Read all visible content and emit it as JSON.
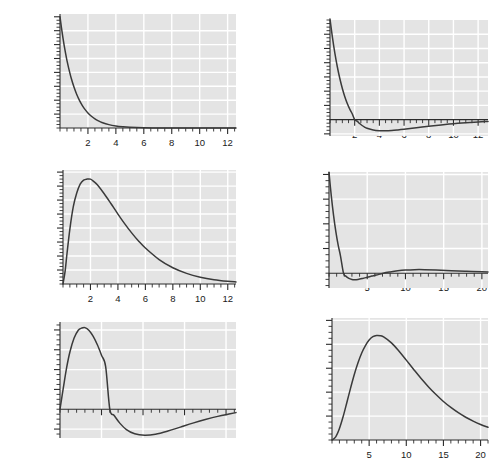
{
  "figure": {
    "title": "",
    "panel_count": 6,
    "background_color": "#e4e4e4",
    "gridline_color": "#ffffff",
    "curve_color": "#3a3a3a",
    "axis_color": "#2b2b2b"
  },
  "chart_data": [
    {
      "id": "1s",
      "type": "line",
      "title": "",
      "annotation": "1s",
      "annotation_n": "1",
      "annotation_l": "s",
      "xlabel": "",
      "ylabel": "",
      "xlim": [
        0,
        12.6
      ],
      "ylim": [
        0,
        2.05
      ],
      "grid": true,
      "xticks_major": [
        2,
        4,
        6,
        8,
        10,
        12
      ],
      "xticklabels": [
        "2",
        "4",
        "6",
        "8",
        "10",
        "12"
      ],
      "xtick_minor_step": 0.5,
      "yticks_major": [
        0.25,
        0.5,
        0.75,
        1,
        1.25,
        1.5,
        1.75,
        2
      ],
      "yticklabels": [
        "0.25",
        "0.5",
        "0.75",
        "1",
        "1.25",
        "1.5",
        "1.75",
        "2"
      ],
      "ytick_minor_step": 0.0625,
      "gridlines_y": [
        0.25,
        0.5,
        0.75,
        1,
        1.25,
        1.5,
        1.75
      ],
      "gridlines_x": [
        2,
        4,
        6,
        8,
        10,
        12
      ],
      "x": [
        0,
        0.1,
        0.2,
        0.3,
        0.4,
        0.5,
        0.6,
        0.8,
        1.0,
        1.2,
        1.4,
        1.6,
        1.8,
        2.0,
        2.25,
        2.5,
        2.75,
        3.0,
        3.5,
        4.0,
        4.5,
        5.0,
        6.0,
        7.0,
        8.0,
        9.0,
        10.0,
        11.0,
        12.0,
        12.6
      ],
      "y": [
        2.0,
        1.81,
        1.637,
        1.482,
        1.341,
        1.213,
        1.098,
        0.898,
        0.736,
        0.602,
        0.493,
        0.404,
        0.331,
        0.271,
        0.211,
        0.164,
        0.128,
        0.0995,
        0.0604,
        0.0366,
        0.0222,
        0.0135,
        0.00496,
        0.00182,
        0.00067,
        0.00025,
        9e-05,
        3e-05,
        1e-05,
        6e-06
      ]
    },
    {
      "id": "2s",
      "type": "line",
      "title": "",
      "annotation": "2s",
      "annotation_n": "2",
      "annotation_l": "s",
      "xlabel": "",
      "ylabel": "",
      "xlim": [
        0,
        12.8
      ],
      "ylim": [
        -0.115,
        0.7
      ],
      "grid": true,
      "xticks_major": [
        2,
        4,
        6,
        8,
        10,
        12
      ],
      "xticklabels": [
        "2",
        "4",
        "6",
        "8",
        "10",
        "12"
      ],
      "xtick_minor_step": 0.5,
      "yticks_major": [
        -0.1,
        0.1,
        0.2,
        0.3,
        0.4,
        0.5,
        0.6
      ],
      "yticklabels": [
        "-0.1",
        "0.1",
        "0.2",
        "0.3",
        "0.4",
        "0.5",
        "0.6"
      ],
      "ytick_minor_step": 0.025,
      "gridlines_y": [
        -0.1,
        0.1,
        0.2,
        0.3,
        0.4,
        0.5,
        0.6
      ],
      "gridlines_x": [
        2,
        4,
        6,
        8,
        10,
        12
      ],
      "zero_crossing": 2.0,
      "minimum": {
        "x": 4.0,
        "y": -0.0918
      },
      "x": [
        0,
        0.2,
        0.4,
        0.6,
        0.8,
        1.0,
        1.2,
        1.4,
        1.6,
        1.8,
        2.0,
        2.2,
        2.4,
        2.6,
        2.8,
        3.0,
        3.5,
        4.0,
        4.5,
        5.0,
        5.5,
        6.0,
        7.0,
        8.0,
        9.0,
        10.0,
        11.0,
        12.0,
        12.8
      ],
      "y": [
        0.707,
        0.576,
        0.464,
        0.368,
        0.287,
        0.219,
        0.161,
        0.113,
        0.0737,
        0.0415,
        0.0,
        -0.0105,
        -0.0276,
        -0.0413,
        -0.0522,
        -0.0607,
        -0.0733,
        -0.0782,
        -0.0787,
        -0.0765,
        -0.0726,
        -0.0678,
        -0.0572,
        -0.0466,
        -0.037,
        -0.0287,
        -0.0219,
        -0.0164,
        -0.0133
      ]
    },
    {
      "id": "2p",
      "type": "line",
      "title": "",
      "annotation": "2p",
      "annotation_n": "2",
      "annotation_l": "p",
      "xlabel": "",
      "ylabel": "",
      "xlim": [
        0,
        12.6
      ],
      "ylim": [
        0,
        0.163
      ],
      "grid": true,
      "xticks_major": [
        2,
        4,
        6,
        8,
        10,
        12
      ],
      "xticklabels": [
        "2",
        "4",
        "6",
        "8",
        "10",
        "12"
      ],
      "xtick_minor_step": 0.5,
      "yticks_major": [
        0.02,
        0.04,
        0.06,
        0.08,
        0.1,
        0.12,
        0.14,
        0.16
      ],
      "yticklabels": [
        "0.02",
        "0.04",
        "0.06",
        "0.08",
        "0.1",
        "0.12",
        "0.14",
        "0.16"
      ],
      "ytick_minor_step": 0.005,
      "gridlines_y": [
        0.02,
        0.04,
        0.06,
        0.08,
        0.1,
        0.12,
        0.14,
        0.16
      ],
      "gridlines_x": [
        2,
        4,
        6,
        8,
        10,
        12
      ],
      "maximum": {
        "x": 2.0,
        "y": 0.15
      },
      "x": [
        0,
        0.15,
        0.3,
        0.5,
        0.75,
        1.0,
        1.25,
        1.5,
        1.75,
        2.0,
        2.25,
        2.5,
        3.0,
        3.5,
        4.0,
        4.5,
        5.0,
        5.5,
        6.0,
        7.0,
        8.0,
        9.0,
        10.0,
        11.0,
        12.0,
        12.6
      ],
      "y": [
        0.0,
        0.0176,
        0.045,
        0.0786,
        0.1106,
        0.13,
        0.1428,
        0.1485,
        0.15,
        0.1499,
        0.1464,
        0.1418,
        0.129,
        0.1147,
        0.1,
        0.086,
        0.0731,
        0.0615,
        0.0514,
        0.0349,
        0.0232,
        0.0152,
        0.0098,
        0.0062,
        0.0039,
        0.003
      ]
    },
    {
      "id": "3s",
      "type": "line",
      "title": "",
      "annotation": "3s",
      "annotation_n": "3",
      "annotation_l": "s",
      "xlabel": "",
      "ylabel": "",
      "xlim": [
        0,
        20.8
      ],
      "ylim": [
        -0.06,
        0.41
      ],
      "grid": true,
      "xticks_major": [
        5,
        10,
        15,
        20
      ],
      "xticklabels": [
        "5",
        "10",
        "15",
        "20"
      ],
      "xtick_minor_step": 1,
      "yticks_major": [
        0.1,
        0.2,
        0.3,
        0.4
      ],
      "yticklabels": [
        "0.1",
        "0.2",
        "0.3",
        "0.4"
      ],
      "ytick_minor_step": 0.025,
      "gridlines_y": [
        0.1,
        0.2,
        0.3,
        0.4
      ],
      "gridlines_x": [
        5,
        10,
        15,
        20
      ],
      "zero_crossings": [
        1.9,
        7.1
      ],
      "minimum": {
        "x": 3.3,
        "y": -0.0265
      },
      "maximum_secondary": {
        "x": 11.2,
        "y": 0.0145
      },
      "x": [
        0,
        0.3,
        0.6,
        0.9,
        1.2,
        1.5,
        1.9,
        2.2,
        2.6,
        3.0,
        3.3,
        3.8,
        4.4,
        5.0,
        5.6,
        6.2,
        7.1,
        8.0,
        9.0,
        10.0,
        11.2,
        12.5,
        14.0,
        16.0,
        18.0,
        20.0,
        20.8
      ],
      "y": [
        0.4085,
        0.313,
        0.233,
        0.167,
        0.1133,
        0.0705,
        0.0,
        -0.012,
        -0.0212,
        -0.0255,
        -0.0265,
        -0.0252,
        -0.0212,
        -0.0165,
        -0.0118,
        -0.0074,
        0.0,
        0.005,
        0.0095,
        0.0125,
        0.0143,
        0.0143,
        0.013,
        0.0103,
        0.0076,
        0.0054,
        0.0046
      ]
    },
    {
      "id": "3p",
      "type": "line",
      "title": "",
      "annotation": "3p",
      "annotation_n": "3",
      "annotation_l": "p",
      "xlabel": "",
      "ylabel": "",
      "xlim": [
        0,
        21.2
      ],
      "ylim": [
        -0.029,
        0.088
      ],
      "grid": true,
      "xticks_major": [
        5,
        10,
        15,
        20
      ],
      "xticklabels": [
        "5",
        "10",
        "15",
        "20"
      ],
      "xtick_minor_step": 1,
      "yticks_major": [
        -0.02,
        0.02,
        0.04,
        0.06,
        0.08
      ],
      "yticklabels": [
        "-0.02",
        "0.02",
        "0.04",
        "0.06",
        "0.08"
      ],
      "ytick_minor_step": 0.005,
      "gridlines_y": [
        -0.02,
        0.02,
        0.04,
        0.06,
        0.08
      ],
      "gridlines_x": [
        5,
        10,
        15,
        20
      ],
      "maximum": {
        "x": 3.0,
        "y": 0.0823
      },
      "zero_crossing": 6.0,
      "minimum": {
        "x": 10.2,
        "y": -0.0262
      },
      "x": [
        0,
        0.4,
        0.8,
        1.2,
        1.7,
        2.2,
        2.6,
        3.0,
        3.5,
        4.0,
        4.5,
        5.0,
        5.5,
        6.0,
        6.5,
        7.2,
        8.0,
        9.0,
        10.2,
        11.5,
        13.0,
        14.5,
        16.0,
        17.5,
        19.0,
        20.5,
        21.2
      ],
      "y": [
        0.0,
        0.0215,
        0.042,
        0.058,
        0.0718,
        0.0797,
        0.0818,
        0.0823,
        0.0795,
        0.0735,
        0.065,
        0.0545,
        0.043,
        0.0,
        -0.006,
        -0.014,
        -0.0205,
        -0.0248,
        -0.0262,
        -0.0252,
        -0.022,
        -0.018,
        -0.014,
        -0.0104,
        -0.0072,
        -0.0046,
        -0.0034
      ]
    },
    {
      "id": "3d",
      "type": "line",
      "title": "",
      "annotation": "3d",
      "annotation_n": "3",
      "annotation_l": "d",
      "xlabel": "",
      "ylabel": "",
      "xlim": [
        0,
        21.0
      ],
      "ylim": [
        0,
        0.051
      ],
      "grid": true,
      "xticks_major": [
        5,
        10,
        15,
        20
      ],
      "xticklabels": [
        "5",
        "10",
        "15",
        "20"
      ],
      "xtick_minor_step": 1,
      "yticks_major": [
        0.01,
        0.02,
        0.03,
        0.04,
        0.05
      ],
      "yticklabels": [
        "0.01",
        "0.02",
        "0.03",
        "0.04",
        "0.05"
      ],
      "ytick_minor_step": 0.0025,
      "gridlines_y": [
        0.01,
        0.02,
        0.03,
        0.04,
        0.05
      ],
      "gridlines_x": [
        5,
        10,
        15,
        20
      ],
      "maximum": {
        "x": 6.0,
        "y": 0.0437
      },
      "x": [
        0,
        0.5,
        1.0,
        1.5,
        2.0,
        2.5,
        3.0,
        3.5,
        4.0,
        4.5,
        5.0,
        5.5,
        6.0,
        6.5,
        7.0,
        8.0,
        9.0,
        10.0,
        11.0,
        12.0,
        13.0,
        14.0,
        15.0,
        16.0,
        17.0,
        18.0,
        19.0,
        20.0,
        21.0
      ],
      "y": [
        0.0,
        0.0013,
        0.0048,
        0.0098,
        0.0157,
        0.0217,
        0.0274,
        0.0323,
        0.0364,
        0.0395,
        0.0418,
        0.0432,
        0.0437,
        0.0436,
        0.043,
        0.0406,
        0.0372,
        0.0334,
        0.0295,
        0.0257,
        0.0222,
        0.019,
        0.0161,
        0.0136,
        0.0114,
        0.0095,
        0.0079,
        0.0065,
        0.0053
      ]
    }
  ]
}
